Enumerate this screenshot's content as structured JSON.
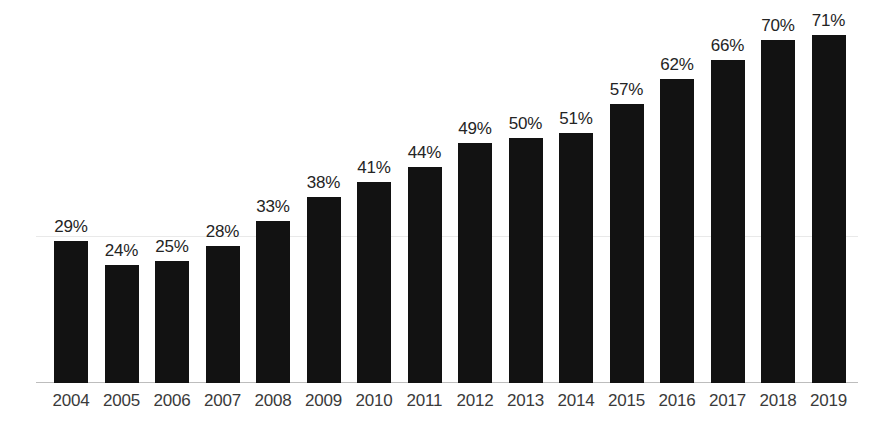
{
  "chart_data": {
    "type": "bar",
    "title": "",
    "subtitle": "",
    "xlabel": "",
    "ylabel": "",
    "categories": [
      "2004",
      "2005",
      "2006",
      "2007",
      "2008",
      "2009",
      "2010",
      "2011",
      "2012",
      "2013",
      "2014",
      "2015",
      "2016",
      "2017",
      "2018",
      "2019"
    ],
    "values": [
      29,
      24,
      25,
      28,
      33,
      38,
      41,
      44,
      49,
      50,
      51,
      57,
      62,
      66,
      70,
      71
    ],
    "data_labels": [
      "29%",
      "24%",
      "25%",
      "28%",
      "33%",
      "38%",
      "41%",
      "44%",
      "49%",
      "50%",
      "51%",
      "57%",
      "62%",
      "66%",
      "70%",
      "71%"
    ],
    "value_suffix": "%",
    "ylim": [
      0,
      75
    ],
    "grid": true,
    "gridlines": [
      30
    ],
    "legend": "none",
    "legend_position": "none",
    "series": [
      {
        "name": "",
        "values": [
          29,
          24,
          25,
          28,
          33,
          38,
          41,
          44,
          49,
          50,
          51,
          57,
          62,
          66,
          70,
          71
        ]
      }
    ],
    "colors": {
      "bar": "#121212",
      "background": "#ffffff",
      "axis_line": "#bdbdbd",
      "gridline": "#e9e9e9",
      "data_label_text": "#242424",
      "tick_label_text": "#3a3a3a"
    }
  }
}
